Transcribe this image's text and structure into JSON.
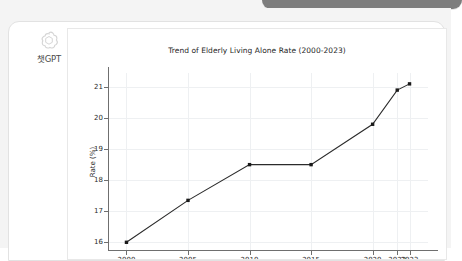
{
  "window": {
    "background_color": "#f4f4f4",
    "top_bar": {
      "name": "partial-toolbar-pill",
      "color": "#7d7d7d"
    }
  },
  "brand": {
    "icon": "openai-knot-icon",
    "label": "챗GPT"
  },
  "chart_data": {
    "type": "line",
    "title": "Trend of Elderly Living Alone Rate (2000-2023)",
    "xlabel": "Year",
    "ylabel": "Rate (%)",
    "grid": true,
    "legend": false,
    "marker": "square",
    "line_color": "#2b2b2b",
    "x": [
      2000,
      2005,
      2010,
      2015,
      2020,
      2022,
      2023
    ],
    "values": [
      16.0,
      17.35,
      18.5,
      18.5,
      19.8,
      20.9,
      21.1
    ],
    "xticks": [
      2000,
      2005,
      2010,
      2015,
      2020,
      2022,
      2023
    ],
    "xtick_labels": [
      "2000",
      "2005",
      "2010",
      "2015",
      "2020",
      "2022",
      "2023"
    ],
    "yticks": [
      16,
      17,
      18,
      19,
      20,
      21
    ],
    "ytick_labels": [
      "16",
      "17",
      "18",
      "19",
      "20",
      "21"
    ],
    "xlim": [
      1998.5,
      2024.5
    ],
    "ylim": [
      15.72,
      21.45
    ]
  }
}
